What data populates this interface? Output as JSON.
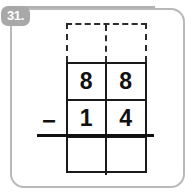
{
  "problem": {
    "number_label": "31.",
    "operator": "−",
    "operator_name": "minus-sign",
    "minuend": "88",
    "subtrahend": "14",
    "answer": "",
    "rows": [
      {
        "name": "regroup-row",
        "style": "dashed",
        "tens": "",
        "ones": ""
      },
      {
        "name": "minuend-row",
        "style": "solid",
        "tens": "8",
        "ones": "8"
      },
      {
        "name": "subtrahend-row",
        "style": "solid",
        "tens": "1",
        "ones": "4"
      },
      {
        "name": "answer-row",
        "style": "solid",
        "tens": "",
        "ones": ""
      }
    ]
  },
  "colors": {
    "badge_background": "#a8a8a8",
    "badge_text": "#ffffff",
    "grid_line": "#1a1a1a",
    "dashed_line": "#2b2b2b",
    "card_border": "#b9b9b9",
    "page_background": "#ffffff",
    "digit_text": "#111111"
  }
}
